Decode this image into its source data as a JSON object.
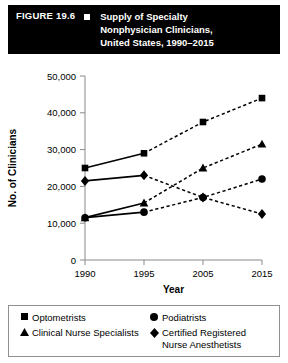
{
  "header": {
    "figure_label": "FIGURE 19.6",
    "bullet_icon": "white-square-bullet",
    "title_lines": [
      "Supply of Specialty",
      "Nonphysician Clinicians,",
      "United States, 1990–2015"
    ]
  },
  "chart_data": {
    "type": "line",
    "title": "Supply of Specialty Nonphysician Clinicians, United States, 1990–2015",
    "xlabel": "Year",
    "ylabel": "No. of Clinicians",
    "categories": [
      "1990",
      "1995",
      "2005",
      "2015"
    ],
    "x_tick_labels": [
      "1990",
      "1995",
      "2005",
      "2015"
    ],
    "y_tick_labels": [
      "0",
      "10,000",
      "20,000",
      "30,000",
      "40,000",
      "50,000"
    ],
    "y_tick_values": [
      0,
      10000,
      20000,
      30000,
      40000,
      50000
    ],
    "ylim": [
      0,
      50000
    ],
    "grid": false,
    "legend_position": "below-plot",
    "line_style_note": {
      "1990-1995": "solid (actual)",
      "1995-2015": "dashed (projected)"
    },
    "series": [
      {
        "name": "Optometrists",
        "marker": "square",
        "values": [
          25000,
          29000,
          37500,
          44000
        ]
      },
      {
        "name": "Podiatrists",
        "marker": "circle",
        "values": [
          11500,
          13000,
          17000,
          22000
        ]
      },
      {
        "name": "Clinical Nurse Specialists",
        "marker": "triangle",
        "values": [
          11500,
          15500,
          25000,
          31500
        ]
      },
      {
        "name": "Certified Registered Nurse Anesthetists",
        "marker": "diamond",
        "values": [
          21500,
          23000,
          17000,
          12500
        ]
      }
    ]
  },
  "legend": {
    "entries": [
      {
        "marker": "square",
        "label": "Optometrists",
        "label_line2": ""
      },
      {
        "marker": "circle",
        "label": "Podiatrists",
        "label_line2": ""
      },
      {
        "marker": "triangle",
        "label": "Clinical Nurse Specialists",
        "label_line2": ""
      },
      {
        "marker": "diamond",
        "label": "Certified Registered",
        "label_line2": "Nurse Anesthetists"
      }
    ]
  }
}
